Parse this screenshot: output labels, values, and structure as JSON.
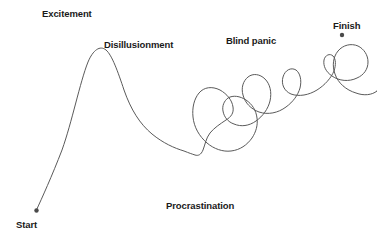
{
  "figure": {
    "background_color": "#ffffff",
    "line_color": "#5a5a5a",
    "dot_color": "#4a4a4a",
    "text_color": "#1a1a1a"
  },
  "labels": {
    "excitement": "Excitement",
    "disillusionment": "Disillusionment",
    "blind_panic": "Blind panic",
    "finish": "Finish",
    "procrastination": "Procrastination",
    "start": "Start"
  },
  "chart_data": {
    "type": "line",
    "xlabel": "",
    "ylabel": "",
    "grid": false,
    "legend": null,
    "xlim": [
      0,
      380
    ],
    "ylim": [
      242,
      0
    ],
    "annotations": [
      {
        "text": "Excitement",
        "x": 42,
        "y": 8,
        "anchor": "start"
      },
      {
        "text": "Disillusionment",
        "x": 104,
        "y": 39,
        "anchor": "start"
      },
      {
        "text": "Blind panic",
        "x": 226,
        "y": 35,
        "anchor": "start"
      },
      {
        "text": "Finish",
        "x": 333,
        "y": 20,
        "anchor": "start"
      },
      {
        "text": "Procrastination",
        "x": 166,
        "y": 200,
        "anchor": "start"
      },
      {
        "text": "Start",
        "x": 16,
        "y": 219,
        "anchor": "start"
      }
    ],
    "markers": [
      {
        "name": "start-point",
        "x": 36,
        "y": 211
      },
      {
        "name": "finish-point",
        "x": 342,
        "y": 35
      }
    ],
    "series": [
      {
        "name": "project-progress",
        "description": "Single continuous hand-drawn line from Start, rising steeply to an Excitement peak, falling through Disillusionment, then looping chaotically through a Procrastination tangle before a Blind panic wiggle up to Finish.",
        "path": "M 36 211 C 42 198 52 176 62 150 C 72 122 80 82 88 62 C 93 50 100 45 106 50 C 112 55 118 72 124 90 C 131 110 140 124 152 134 C 163 143 174 148 184 151 C 189 153 192 154 195 155 C 198 156 201 155 203 150 C 205 145 206 138 210 133 C 214 128 220 124 226 120 C 231 117 234 113 233 107 C 232 100 227 94 220 90 C 212 86 204 87 199 93 C 194 99 192 108 193 117 C 194 127 199 136 207 143 C 214 149 223 152 231 151 C 240 150 247 145 252 138 C 256 132 258 125 257 118 C 256 110 252 104 246 100 C 240 96 233 95 228 98 C 224 101 222 106 223 111 C 224 117 228 122 234 124 C 241 127 249 126 256 121 C 263 116 268 109 270 101 C 272 92 270 84 265 79 C 260 74 253 73 248 77 C 243 81 241 88 243 95 C 245 103 251 109 259 112 C 268 115 278 113 286 107 C 293 102 298 95 300 88 C 302 80 300 73 296 70 C 291 67 285 70 283 77 C 281 84 284 91 291 94 C 299 97 309 95 317 90 C 325 85 331 78 334 71 C 336 65 336 59 333 56 C 330 53 325 55 324 60 C 323 66 326 72 332 76 C 339 81 349 82 357 78 C 364 75 368 69 368 62 C 368 55 364 49 358 46 C 351 43 343 45 338 51 C 333 57 332 66 335 74 C 338 83 346 90 356 93 C 364 96 372 95 377 91 L 377 91",
        "points_of_interest": [
          {
            "label": "Start",
            "x": 36,
            "y": 211
          },
          {
            "label": "Excitement",
            "x": 88,
            "y": 48
          },
          {
            "label": "Disillusionment",
            "x": 150,
            "y": 125
          },
          {
            "label": "Procrastination",
            "x": 250,
            "y": 150
          },
          {
            "label": "Blind panic",
            "x": 285,
            "y": 60
          },
          {
            "label": "Finish",
            "x": 342,
            "y": 35
          }
        ]
      }
    ]
  }
}
